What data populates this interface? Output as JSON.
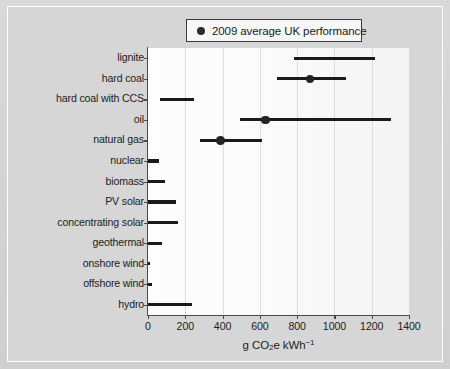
{
  "legend": {
    "marker_icon": "filled-circle-icon",
    "label": "2009 average UK performance"
  },
  "axis": {
    "xlabel_prefix": "g CO",
    "xlabel_sub": "2",
    "xlabel_mid": "e kWh",
    "xlabel_sup": "−1",
    "xlabel_full": "g CO2e kWh-1",
    "xticks": [
      "0",
      "200",
      "400",
      "600",
      "800",
      "1000",
      "1200",
      "1400"
    ]
  },
  "chart_data": {
    "type": "bar",
    "title": "",
    "xlabel": "g CO2e kWh-1",
    "ylabel": "",
    "xlim": [
      0,
      1400
    ],
    "grid": true,
    "legend_position": "top-center",
    "orientation": "horizontal",
    "note": "Horizontal range bars show low-to-high lifecycle emissions; dots mark 2009 average UK performance",
    "categories": [
      "lignite",
      "hard coal",
      "hard coal with CCS",
      "oil",
      "natural gas",
      "nuclear",
      "biomass",
      "PV solar",
      "concentrating solar",
      "geothermal",
      "onshore wind",
      "offshore wind",
      "hydro"
    ],
    "ranges": [
      [
        785,
        1215
      ],
      [
        690,
        1060
      ],
      [
        65,
        245
      ],
      [
        495,
        1305
      ],
      [
        280,
        610
      ],
      [
        0,
        60
      ],
      [
        0,
        90
      ],
      [
        0,
        150
      ],
      [
        0,
        160
      ],
      [
        0,
        75
      ],
      [
        0,
        12
      ],
      [
        0,
        20
      ],
      [
        0,
        235
      ]
    ],
    "markers": [
      null,
      870,
      null,
      630,
      390,
      null,
      null,
      null,
      null,
      null,
      null,
      null,
      null
    ],
    "series": [
      {
        "name": "range low",
        "values": [
          785,
          690,
          65,
          495,
          280,
          0,
          0,
          0,
          0,
          0,
          0,
          0,
          0
        ]
      },
      {
        "name": "range high",
        "values": [
          1215,
          1060,
          245,
          1305,
          610,
          60,
          90,
          150,
          160,
          75,
          12,
          20,
          235
        ]
      },
      {
        "name": "2009 average UK performance",
        "values": [
          null,
          870,
          null,
          630,
          390,
          null,
          null,
          null,
          null,
          null,
          null,
          null,
          null
        ]
      }
    ]
  },
  "colors": {
    "bar": "#1a1a1a",
    "marker": "#242424",
    "plot_background": "#fbfbfb",
    "figure_background": "#d6d6d6",
    "gridline": "#dcdcdc",
    "axis": "#4a4a4a"
  }
}
